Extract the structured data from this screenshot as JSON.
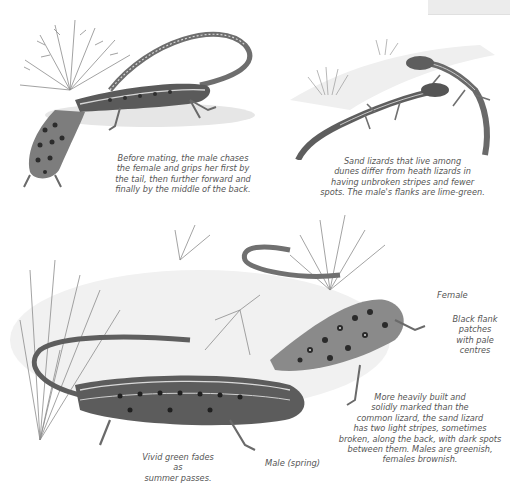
{
  "page": {
    "type": "field-guide-illustration-page",
    "subject": "Sand lizard",
    "color_mode": "grayscale"
  },
  "illustrations": [
    {
      "id": "mating-pair",
      "description": "Male lizard chasing and gripping female amid heather"
    },
    {
      "id": "dune-pair",
      "description": "Two sand lizards on dunes with marram grass"
    },
    {
      "id": "heath-pair",
      "description": "Female and spring male sand lizards among heath twigs"
    }
  ],
  "captions": {
    "mating": "Before mating, the male chases the female and grips her first by the tail, then further forward and finally by the middle of the back.",
    "dunes": "Sand lizards that live among dunes differ from heath lizards in having unbroken stripes and fewer spots. The male's flanks are lime-green.",
    "description": "More heavily built and solidly marked than the common lizard, the sand lizard has two light stripes, sometimes broken, along the back, with dark spots between them. Males are greenish, females brownish.",
    "fade": "Vivid green fades as summer passes."
  },
  "caption_lines": {
    "mating": [
      "Before mating, the male chases",
      "the female and grips her first by",
      "the tail, then further forward and",
      "finally by the middle of the back."
    ],
    "dunes": [
      "Sand lizards that live among",
      "dunes differ from heath lizards in",
      "having unbroken stripes and fewer",
      "spots. The male's flanks are lime-green."
    ],
    "description": [
      "More heavily built and",
      "solidly marked than the",
      "common lizard, the sand lizard",
      "has two light stripes, sometimes",
      "broken, along the back, with dark spots",
      "between them. Males are greenish,",
      "females brownish."
    ],
    "fade": [
      "Vivid green fades as",
      "summer passes."
    ],
    "flank": [
      "Black flank",
      "patches",
      "with pale",
      "centres"
    ]
  },
  "labels": {
    "female": "Female",
    "male": "Male (spring)"
  },
  "colors": {
    "background": "#ffffff",
    "text": "#555555",
    "ink_dark": "#2e2e2e",
    "ink_mid": "#7a7a7a",
    "ink_light": "#c8c8c8"
  }
}
